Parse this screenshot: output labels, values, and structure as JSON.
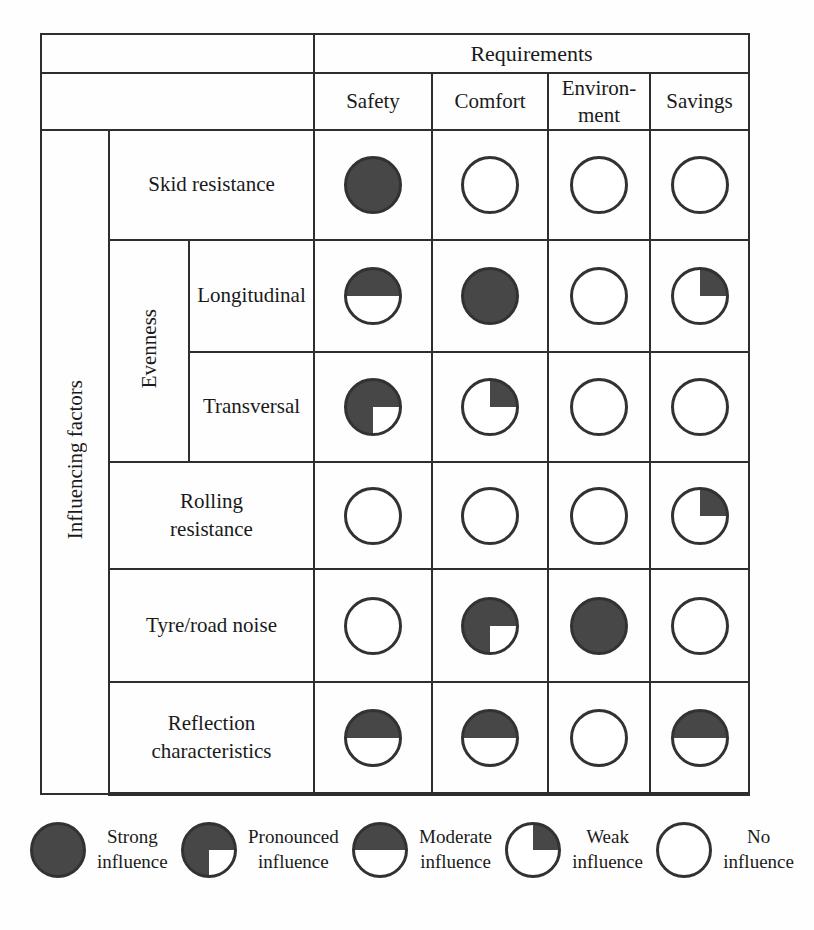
{
  "colors": {
    "fill": "#474747",
    "ring": "#323232",
    "line": "#2e2e2e",
    "text": "#1a1a1a"
  },
  "matrix": {
    "requirements_label": "Requirements",
    "columns": [
      "Safety",
      "Comfort",
      "Environ-\nment",
      "Savings"
    ],
    "factors_label": "Influencing factors",
    "evenness_label": "Evenness",
    "rows": [
      {
        "label": "Skid resistance",
        "values": [
          "strong",
          "none",
          "none",
          "none"
        ]
      },
      {
        "label": "Longitudinal",
        "values": [
          "moderate",
          "strong",
          "none",
          "weak"
        ]
      },
      {
        "label": "Transversal",
        "values": [
          "pronounced",
          "weak",
          "none",
          "none"
        ]
      },
      {
        "label": "Rolling\nresistance",
        "values": [
          "none",
          "none",
          "none",
          "weak"
        ]
      },
      {
        "label": "Tyre/road noise",
        "values": [
          "none",
          "pronounced",
          "strong",
          "none"
        ]
      },
      {
        "label": "Reflection\ncharacteristics",
        "values": [
          "moderate",
          "moderate",
          "none",
          "moderate"
        ]
      }
    ]
  },
  "legend": {
    "items": [
      {
        "level": "strong",
        "label": "Strong\ninfluence"
      },
      {
        "level": "pronounced",
        "label": "Pronounced\ninfluence"
      },
      {
        "level": "moderate",
        "label": "Moderate\ninfluence"
      },
      {
        "level": "weak",
        "label": "Weak\ninfluence"
      },
      {
        "level": "none",
        "label": "No\ninfluence"
      }
    ]
  }
}
